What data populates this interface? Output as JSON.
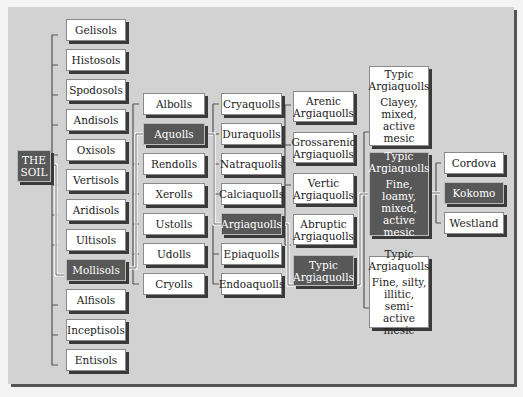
{
  "root": {
    "label_line1": "THE",
    "label_line2": "SOIL"
  },
  "orders": [
    "Gelisols",
    "Histosols",
    "Spodosols",
    "Andisols",
    "Oxisols",
    "Vertisols",
    "Aridisols",
    "Ultisols",
    "Mollisols",
    "Alfisols",
    "Inceptisols",
    "Entisols"
  ],
  "selected_order": "Mollisols",
  "suborders": [
    "Albolls",
    "Aquolls",
    "Rendolls",
    "Xerolls",
    "Ustolls",
    "Udolls",
    "Cryolls"
  ],
  "selected_suborder": "Aquolls",
  "great_groups": [
    "Cryaquolls",
    "Duraquolls",
    "Natraquolls",
    "Calciaquolls",
    "Argiaquolls",
    "Epiaquolls",
    "Endoaquolls"
  ],
  "selected_great_group": "Argiaquolls",
  "subgroups": [
    {
      "line1": "Arenic",
      "line2": "Argiaquolls"
    },
    {
      "line1": "Grossarenic",
      "line2": "Argiaquolls"
    },
    {
      "line1": "Vertic",
      "line2": "Argiaquolls"
    },
    {
      "line1": "Abruptic",
      "line2": "Argiaquolls"
    },
    {
      "line1": "Typic",
      "line2": "Argiaquolls"
    }
  ],
  "selected_subgroup": "Typic Argiaquolls",
  "families": [
    {
      "title1": "Typic",
      "title2": "Argiaquolls",
      "desc": [
        "Clayey,",
        "mixed,",
        "active",
        "mesic"
      ]
    },
    {
      "title1": "Typic",
      "title2": "Argiaquolls",
      "desc": [
        "Fine, loamy,",
        "mixed,",
        "active",
        "mesic"
      ]
    },
    {
      "title1": "Typic",
      "title2": "Argiaquolls",
      "desc": [
        "Fine, silty,",
        "illitic,",
        "semi-active",
        "mesic"
      ]
    }
  ],
  "selected_family": "Fine, loamy, mixed, active mesic",
  "series": [
    "Cordova",
    "Kokomo",
    "Westland"
  ],
  "selected_series": "Kokomo"
}
